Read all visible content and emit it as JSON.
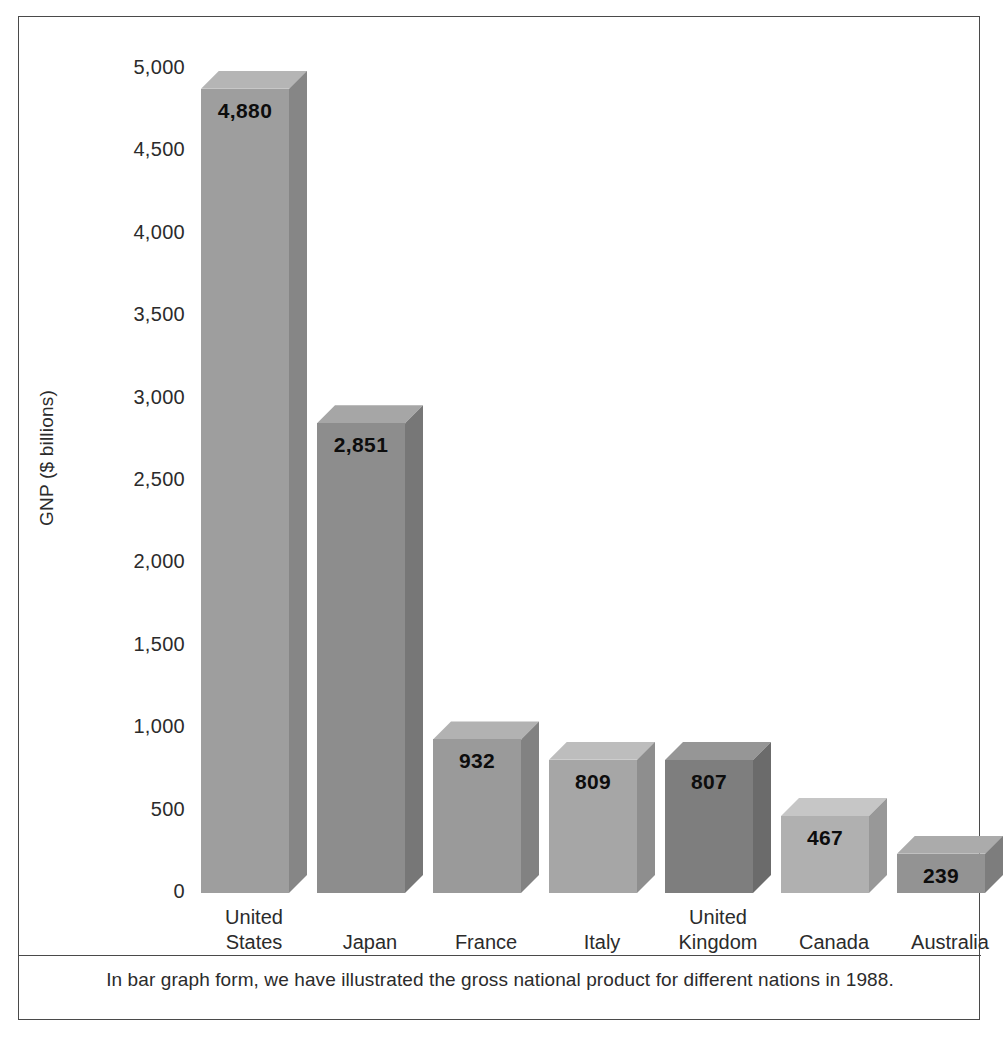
{
  "chart_data": {
    "type": "bar",
    "title": "",
    "xlabel": "",
    "ylabel": "GNP ($ billions)",
    "ylim": [
      0,
      5000
    ],
    "ytick_labels": [
      "5,000",
      "4,500",
      "4,000",
      "3,500",
      "3,000",
      "2,500",
      "2,000",
      "1,500",
      "1,000",
      "500",
      "0"
    ],
    "ytick_values": [
      5000,
      4500,
      4000,
      3500,
      3000,
      2500,
      2000,
      1500,
      1000,
      500,
      0
    ],
    "grid": false,
    "legend": "none",
    "categories": [
      "United States",
      "Japan",
      "France",
      "Italy",
      "United Kingdom",
      "Canada",
      "Australia"
    ],
    "category_label_lines": [
      [
        "United",
        "States"
      ],
      [
        "Japan"
      ],
      [
        "France"
      ],
      [
        "Italy"
      ],
      [
        "United",
        "Kingdom"
      ],
      [
        "Canada"
      ],
      [
        "Australia"
      ]
    ],
    "values": [
      4880,
      2851,
      932,
      809,
      807,
      467,
      239
    ],
    "value_labels": [
      "4,880",
      "2,851",
      "932",
      "809",
      "807",
      "467",
      "239"
    ],
    "bar_colors": [
      "#9e9e9e",
      "#8d8d8d",
      "#9a9a9a",
      "#a6a6a6",
      "#7e7e7e",
      "#b0b0b0",
      "#939393"
    ],
    "bar_top_colors": [
      "#b5b5b5",
      "#a6a6a6",
      "#b2b2b2",
      "#bdbdbd",
      "#969696",
      "#c6c6c6",
      "#ababab"
    ],
    "bar_side_colors": [
      "#868686",
      "#777777",
      "#828282",
      "#8e8e8e",
      "#6b6b6b",
      "#989898",
      "#7d7d7d"
    ]
  },
  "caption": {
    "text": "In bar graph form, we have illustrated the gross national product for different nations in 1988."
  },
  "colors": {
    "frame_border": "#4a4a4a",
    "text": "#2b2b2b",
    "value_text": "#0d0d0d",
    "background": "#ffffff"
  }
}
